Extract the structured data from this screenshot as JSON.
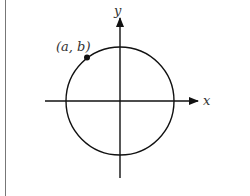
{
  "diagram": {
    "title": "",
    "axes": {
      "x_label": "x",
      "y_label": "y"
    },
    "circle": {
      "center": "origin"
    },
    "point": {
      "label": "(a, b)",
      "quadrant": "II"
    }
  }
}
